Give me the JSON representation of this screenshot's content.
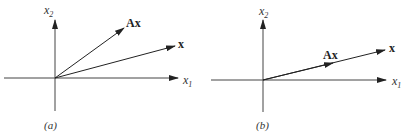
{
  "panels": [
    {
      "id": "a",
      "caption": "(a)",
      "x_axis_label": "x",
      "x_axis_sub": "1",
      "y_axis_label": "x",
      "y_axis_sub": "2",
      "vectors": [
        {
          "label": "Ax",
          "description": "image vector, rotated away from x"
        },
        {
          "label": "x",
          "description": "original vector"
        }
      ]
    },
    {
      "id": "b",
      "caption": "(b)",
      "x_axis_label": "x",
      "x_axis_sub": "1",
      "y_axis_label": "x",
      "y_axis_sub": "2",
      "vectors": [
        {
          "label": "Ax",
          "description": "image vector, same direction as x (eigenvector)"
        },
        {
          "label": "x",
          "description": "original vector"
        }
      ]
    }
  ],
  "colors": {
    "line": "#222222",
    "axis": "#444444",
    "background": "#ffffff"
  }
}
